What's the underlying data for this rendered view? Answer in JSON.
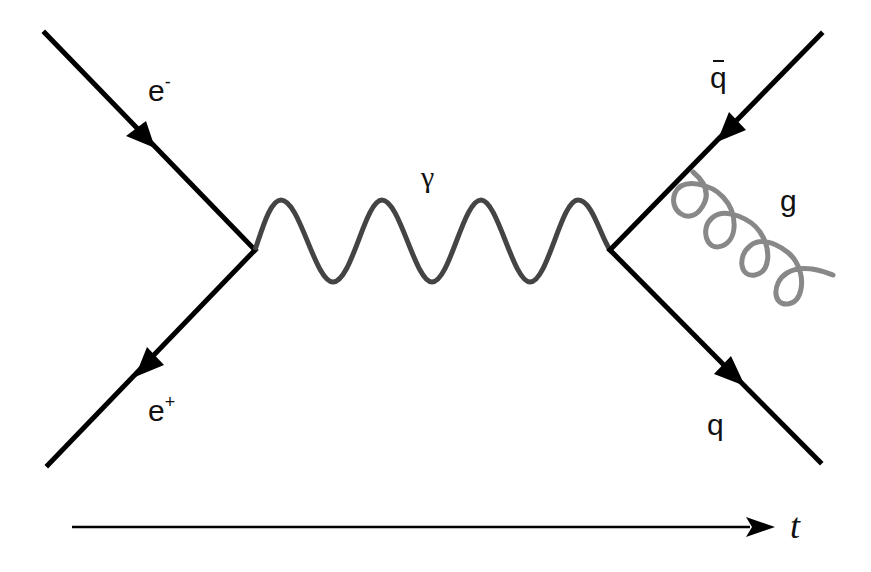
{
  "diagram": {
    "type": "feynman",
    "process": "e- e+ -> gamma -> q qbar g",
    "colors": {
      "fermion": "#000000",
      "photon": "#444444",
      "gluon": "#888888",
      "background": "#ffffff"
    },
    "labels": {
      "electron": "e",
      "electron_sup": "-",
      "positron": "e",
      "positron_sup": "+",
      "photon": "γ",
      "antiquark": "q",
      "quark": "q",
      "gluon": "g",
      "time": "t"
    },
    "edges": [
      {
        "id": "e-minus",
        "kind": "fermion",
        "label": "e⁻",
        "from": "in-top-left",
        "to": "vertex-left"
      },
      {
        "id": "e-plus",
        "kind": "fermion",
        "label": "e⁺",
        "from": "vertex-left",
        "to": "in-bottom-left"
      },
      {
        "id": "photon",
        "kind": "photon",
        "label": "γ",
        "from": "vertex-left",
        "to": "vertex-right"
      },
      {
        "id": "q-bar",
        "kind": "fermion",
        "label": "q̄",
        "from": "out-top-right",
        "to": "vertex-right"
      },
      {
        "id": "q",
        "kind": "fermion",
        "label": "q",
        "from": "vertex-right",
        "to": "out-bottom-right"
      },
      {
        "id": "gluon",
        "kind": "gluon",
        "label": "g",
        "from": "q-bar line",
        "to": "out-right"
      }
    ],
    "time_axis": {
      "direction": "left-to-right",
      "label": "t"
    }
  }
}
